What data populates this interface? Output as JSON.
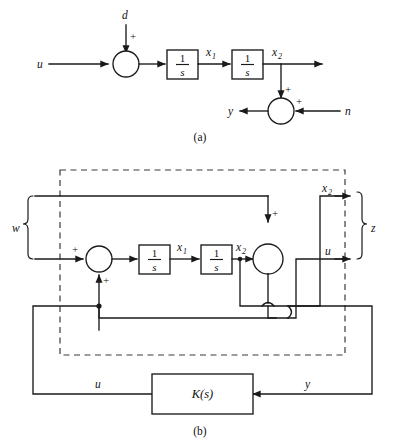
{
  "figure": {
    "panels": [
      {
        "id": "a",
        "caption": "(a)",
        "signals": {
          "input_u": "u",
          "disturbance_d": "d",
          "state_x1": "x",
          "state_x1_sub": "1",
          "state_x2": "x",
          "state_x2_sub": "2",
          "output_y": "y",
          "noise_n": "n"
        },
        "blocks": [
          {
            "name": "integrator-1",
            "numerator": "1",
            "denominator": "s"
          },
          {
            "name": "integrator-2",
            "numerator": "1",
            "denominator": "s"
          }
        ],
        "summing_junctions": [
          {
            "name": "sum-u-d",
            "signs": [
              "+"
            ]
          },
          {
            "name": "sum-y-n",
            "signs": [
              "+",
              "+"
            ]
          }
        ]
      },
      {
        "id": "b",
        "caption": "(b)",
        "signals": {
          "exogenous_w": "w",
          "performance_z": "z",
          "state_x1": "x",
          "state_x1_sub": "1",
          "state_x2_inner": "x",
          "state_x2_inner_sub": "2",
          "state_x2_out": "x",
          "state_x2_out_sub": "2",
          "control_u_out": "u",
          "control_u_fb": "u",
          "measured_y": "y"
        },
        "blocks": [
          {
            "name": "integrator-1",
            "numerator": "1",
            "denominator": "s"
          },
          {
            "name": "integrator-2",
            "numerator": "1",
            "denominator": "s"
          },
          {
            "name": "controller",
            "label": "K(s)"
          }
        ],
        "summing_junctions": [
          {
            "name": "sum-left",
            "signs": [
              "+",
              "+"
            ]
          },
          {
            "name": "sum-right",
            "signs": [
              "+",
              "+"
            ]
          }
        ],
        "generalized_plant_boundary": "dashed"
      }
    ],
    "colors": {
      "line": "#1a1a1a",
      "dashed_line": "#3a3a3a",
      "background": "#ffffff",
      "text": "#111111"
    }
  }
}
